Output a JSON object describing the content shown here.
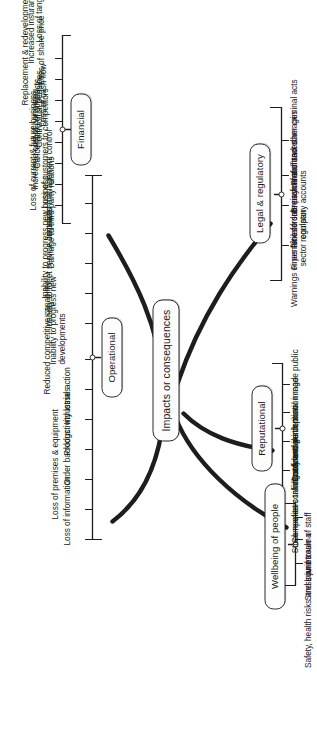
{
  "diagram": {
    "type": "mind-map",
    "orientation": "rotated-90-ccw",
    "center": {
      "label": "Impacts or consequences"
    },
    "colors": {
      "stroke": "#2b2b2b",
      "text": "#161616",
      "node_fill": "#fdfdfd",
      "background": "#ffffff"
    },
    "branches": [
      {
        "id": "operational",
        "label": "Operational",
        "items": [
          "Loss of information",
          "Loss of premises & equipment",
          "Order backlogs",
          "Productivity losses",
          "Industrial action",
          "Reduced competitive capability",
          "Inability to progress new\ndevelopments",
          "Inability to meet service contracts",
          "Inability to progress new business",
          "Damage to third party relations",
          "Impaired management control",
          "Loss of customers to competitors"
        ]
      },
      {
        "id": "financial",
        "label": "Financial",
        "items": [
          "Loss of current & future business",
          "Increased cost of borrowing",
          "Cancellation of contracts",
          "Contractual penalties",
          "Loss of cash flow",
          "Replacement & redevelopment costs",
          "Loss of share price",
          "Increased insurance premiums",
          "Loss of tangible assets"
        ]
      },
      {
        "id": "wellbeing",
        "label": "Wellbeing of people",
        "items": [
          "Safety, health risks and injuries",
          "Stress and trauma",
          "Low morale of staff"
        ]
      },
      {
        "id": "reputational",
        "label": "Reputational",
        "items": [
          "Stock market confidence",
          "Competitors taking advantage",
          "Customer perception",
          "Industry and institutional image",
          "Confidential information made public"
        ]
      },
      {
        "id": "legal",
        "label": "Legal & regulatory",
        "items": [
          "Warnings or penalties from\nsector regulator",
          "Fines for late submission of\ncompany accounts",
          "Fine for late payment of taxes",
          "Breach of contract damages",
          "Fraud and other criminal acts"
        ]
      }
    ]
  }
}
